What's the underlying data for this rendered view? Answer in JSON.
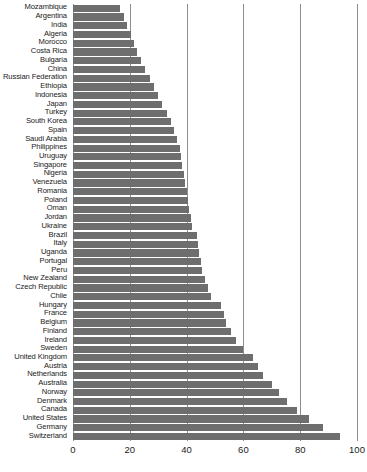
{
  "chart_data": {
    "type": "bar",
    "orientation": "horizontal",
    "title": "",
    "subtitle": "",
    "xlabel": "",
    "ylabel": "",
    "xlim": [
      0,
      100
    ],
    "ylim": null,
    "grid": true,
    "gridlines_axis": "x",
    "legend": null,
    "legend_position": "none",
    "bar_color": "#6e6e6e",
    "gridline_color": "#8e8e8e",
    "x_ticks": [
      0,
      20,
      40,
      60,
      80,
      100
    ],
    "x_tick_labels": [
      "0",
      "20",
      "40",
      "60",
      "80",
      "100"
    ],
    "categories": [
      "Mozambique",
      "Argentina",
      "India",
      "Algeria",
      "Morocco",
      "Costa Rica",
      "Bulgaria",
      "China",
      "Russian Federation",
      "Ethiopia",
      "Indonesia",
      "Japan",
      "Turkey",
      "South Korea",
      "Spain",
      "Saudi Arabia",
      "Philippines",
      "Uruguay",
      "Singapore",
      "Nigeria",
      "Venezuela",
      "Romania",
      "Poland",
      "Oman",
      "Jordan",
      "Ukraine",
      "Brazil",
      "Italy",
      "Uganda",
      "Portugal",
      "Peru",
      "New Zealand",
      "Czech Republic",
      "Chile",
      "Hungary",
      "France",
      "Belgium",
      "Finland",
      "Ireland",
      "Sweden",
      "United Kingdom",
      "Austria",
      "Netherlands",
      "Australia",
      "Norway",
      "Denmark",
      "Canada",
      "United States",
      "Germany",
      "Switzerland"
    ],
    "values": [
      16.5,
      18.0,
      19.0,
      20.5,
      21.5,
      22.5,
      24.0,
      25.5,
      27.0,
      28.5,
      30.0,
      31.5,
      33.0,
      34.5,
      35.5,
      36.5,
      37.5,
      38.0,
      38.5,
      39.0,
      39.5,
      40.0,
      40.5,
      41.0,
      41.5,
      42.0,
      43.5,
      44.0,
      44.5,
      45.0,
      45.5,
      46.5,
      47.5,
      48.5,
      52.0,
      53.0,
      54.0,
      55.5,
      57.5,
      60.0,
      63.5,
      65.0,
      67.0,
      70.0,
      72.5,
      75.5,
      79.0,
      83.0,
      88.0,
      94.0
    ]
  }
}
